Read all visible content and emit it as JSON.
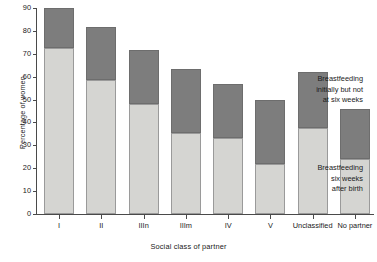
{
  "chart_data": {
    "type": "bar",
    "subtype": "stacked",
    "title": "",
    "xlabel": "Social class of partner",
    "ylabel": "Percentage of women",
    "ylim": [
      0,
      90
    ],
    "yticks": [
      0,
      10,
      20,
      30,
      40,
      50,
      60,
      70,
      80,
      90
    ],
    "grid": false,
    "legend_position": "inside-right",
    "categories": [
      "I",
      "II",
      "IIIn",
      "IIIm",
      "IV",
      "V",
      "Unclassified",
      "No partner"
    ],
    "series": [
      {
        "name": "Breastfeeding six weeks after birth",
        "color": "#d5d5d2",
        "values": [
          72.5,
          58.5,
          48.0,
          35.5,
          33.0,
          22.0,
          37.5,
          24.0
        ]
      },
      {
        "name": "Breastfeeding initially but not at six weeks",
        "color": "#7d7d7d",
        "values": [
          17.5,
          23.0,
          23.5,
          28.0,
          24.0,
          28.0,
          24.5,
          22.0
        ]
      }
    ],
    "totals": [
      90.0,
      81.5,
      71.5,
      63.5,
      57.0,
      50.0,
      62.0,
      46.0
    ],
    "annotations": [
      {
        "id": "top",
        "lines": [
          "Breastfeeding",
          "initially but not",
          "at six weeks"
        ],
        "refers_to": "Breastfeeding initially but not at six weeks"
      },
      {
        "id": "bottom",
        "lines": [
          "Breastfeeding",
          "six weeks",
          "after birth"
        ],
        "refers_to": "Breastfeeding six weeks after birth"
      }
    ]
  },
  "axis": {
    "y_title": "Percentage of women",
    "x_title": "Social class of partner"
  },
  "colors": {
    "segment_top": "#7d7d7d",
    "segment_bottom": "#d5d5d2",
    "axis": "#4a4a4a",
    "text": "#1a1a1a",
    "background": "#ffffff"
  }
}
